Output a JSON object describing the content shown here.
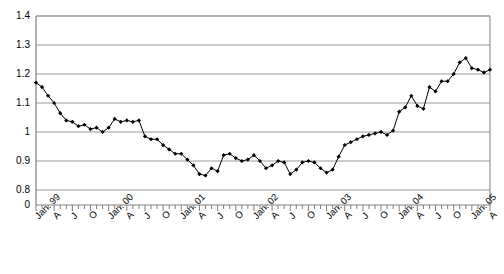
{
  "chart_data": {
    "type": "line",
    "title": "",
    "xlabel": "",
    "ylabel": "",
    "ylim": [
      0.8,
      1.4
    ],
    "y_axis_broken": true,
    "y_break_base_label": "0",
    "ytick_labels": [
      "1.4",
      "1.3",
      "1.2",
      "1.1",
      "1",
      "0.9",
      "0.8",
      "0"
    ],
    "ytick_values": [
      1.4,
      1.3,
      1.2,
      1.1,
      1.0,
      0.9,
      0.8,
      0
    ],
    "grid": true,
    "grid_axis": "y",
    "legend": false,
    "marker": "filled-diamond",
    "line_color": "#000000",
    "marker_color": "#000000",
    "grid_color": "#999999",
    "axis_color": "#808080",
    "plot_bgcolor": "#ffffff",
    "xtick_labels": [
      "Jan. 99",
      "A",
      "J",
      "O",
      "Jan. 00",
      "A",
      "J",
      "O",
      "Jan. 01",
      "A",
      "J",
      "O",
      "Jan. 02",
      "A",
      "J",
      "O",
      "Jan. 03",
      "A",
      "J",
      "O",
      "Jan. 04",
      "A",
      "J",
      "O",
      "Jan. 05",
      "A"
    ],
    "xtick_indices": [
      0,
      3,
      6,
      9,
      12,
      15,
      18,
      21,
      24,
      27,
      30,
      33,
      36,
      39,
      42,
      45,
      48,
      51,
      54,
      57,
      60,
      63,
      66,
      69,
      72,
      75
    ],
    "x_minor_tick_count": 76,
    "x_start": "Jan 1999",
    "x_end": "Apr 2005",
    "x_frequency": "monthly",
    "values": [
      1.17,
      1.155,
      1.125,
      1.1,
      1.065,
      1.04,
      1.035,
      1.02,
      1.025,
      1.01,
      1.015,
      1.0,
      1.015,
      1.045,
      1.035,
      1.04,
      1.035,
      1.04,
      0.985,
      0.975,
      0.975,
      0.955,
      0.94,
      0.925,
      0.925,
      0.905,
      0.885,
      0.855,
      0.85,
      0.875,
      0.865,
      0.92,
      0.925,
      0.91,
      0.9,
      0.905,
      0.92,
      0.9,
      0.875,
      0.885,
      0.9,
      0.895,
      0.855,
      0.87,
      0.895,
      0.9,
      0.895,
      0.875,
      0.86,
      0.87,
      0.915,
      0.955,
      0.965,
      0.975,
      0.985,
      0.99,
      0.995,
      1.0,
      0.99,
      1.005,
      1.07,
      1.085,
      1.125,
      1.09,
      1.08,
      1.155,
      1.14,
      1.175,
      1.175,
      1.2,
      1.24,
      1.255,
      1.22,
      1.215,
      1.205,
      1.215
    ]
  }
}
